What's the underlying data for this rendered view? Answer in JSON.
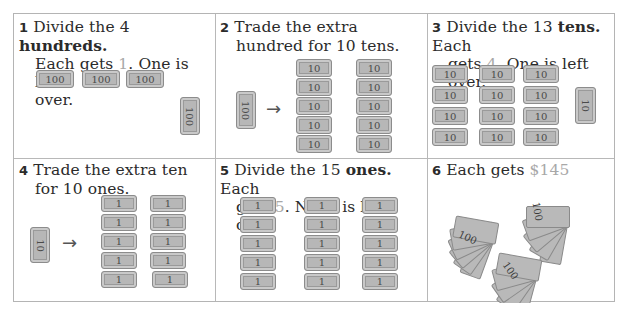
{
  "panels": [
    {
      "number": "1",
      "caption": {
        "pre": "Divide the 4 ",
        "bold": "hundreds.",
        "line2_pre": "Each gets ",
        "highlight": "1",
        "line2_post": ". One is left",
        "line3": "over."
      },
      "bills": [
        "100",
        "100",
        "100"
      ],
      "leftover": "100"
    },
    {
      "number": "2",
      "caption": {
        "line1": "Trade the extra",
        "line2": "hundred for 10 tens."
      },
      "from_bill": "100",
      "arrow": "→",
      "to_bills": [
        "10",
        "10",
        "10",
        "10",
        "10",
        "10",
        "10",
        "10",
        "10",
        "10"
      ]
    },
    {
      "number": "3",
      "caption": {
        "pre": "Divide the 13 ",
        "bold": "tens.",
        "post": " Each",
        "line2_pre": "gets ",
        "highlight": "4",
        "line2_post": ". One is left over."
      },
      "groups": [
        [
          "10",
          "10",
          "10",
          "10"
        ],
        [
          "10",
          "10",
          "10",
          "10"
        ],
        [
          "10",
          "10",
          "10",
          "10"
        ]
      ],
      "leftover": "10"
    },
    {
      "number": "4",
      "caption": {
        "line1": "Trade the extra ten",
        "line2": "for 10 ones."
      },
      "from_bill": "10",
      "arrow": "→",
      "to_bills": [
        "1",
        "1",
        "1",
        "1",
        "1",
        "1",
        "1",
        "1",
        "1",
        "1"
      ]
    },
    {
      "number": "5",
      "caption": {
        "pre": "Divide the 15 ",
        "bold": "ones.",
        "post": " Each",
        "line2_pre": "gets ",
        "highlight": "5",
        "line2_post": ". None is left over."
      },
      "groups": [
        [
          "1",
          "1",
          "1",
          "1",
          "1"
        ],
        [
          "1",
          "1",
          "1",
          "1",
          "1"
        ],
        [
          "1",
          "1",
          "1",
          "1",
          "1"
        ]
      ]
    },
    {
      "number": "6",
      "caption": {
        "pre": "Each gets ",
        "highlight": "$145"
      },
      "fans": [
        "100",
        "100",
        "100"
      ]
    }
  ],
  "colors": {
    "bill_fill": "#b7b7b7",
    "bill_border": "#8c8c8c",
    "highlight_text": "#a8a8a8",
    "grid_line": "#b8b8b8"
  }
}
